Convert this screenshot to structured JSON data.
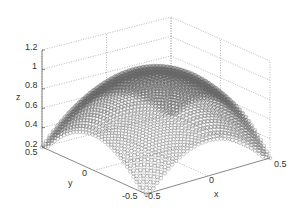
{
  "chart_data": {
    "type": "scatter3d",
    "title": "",
    "xlabel": "x",
    "ylabel": "y",
    "zlabel": "z",
    "xlim": [
      -0.5,
      0.5
    ],
    "ylim": [
      -0.5,
      0.5
    ],
    "zlim": [
      0.2,
      1.2
    ],
    "x_ticks": [
      "-0.5",
      "0",
      "0.5"
    ],
    "y_ticks": [
      "-0.5",
      "0",
      "0.5"
    ],
    "z_ticks": [
      "0.2",
      "0.4",
      "0.6",
      "0.8",
      "1",
      "1.2"
    ],
    "grid": true,
    "marker": "circle",
    "marker_color": "#666666",
    "surface_peak_z": 1.05,
    "surface_edge_z": 0.2
  },
  "labels": {
    "x": "x",
    "y": "y",
    "z": "z",
    "z_ticks": [
      "1.2",
      "1",
      "0.8",
      "0.6",
      "0.4",
      "0.2"
    ],
    "y_ticks": [
      "0.5",
      "0",
      "-0.5"
    ],
    "x_ticks": [
      "-0.5",
      "0",
      "0.5"
    ]
  }
}
